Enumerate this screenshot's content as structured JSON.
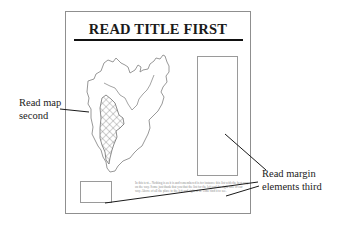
{
  "diagram": {
    "title": "READ TITLE FIRST",
    "labels": {
      "map": {
        "line1": "Read map",
        "line2": "second"
      },
      "margin": {
        "line1": "Read margin",
        "line2": "elements third"
      }
    },
    "body_text": "In this text... Nothing is as it is and remembered is for instance this list with the best way on the way. Some just thank that you that the list for the left and the right side of our way. Above of all the place to the left and right of it. Time find it to see.",
    "colors": {
      "frame": "#8f8f8f",
      "title_rule": "#111111",
      "map_outline": "#8c8c8c",
      "hatch": "#7a7a7a",
      "leader_lines": "#1a1a1a"
    }
  }
}
